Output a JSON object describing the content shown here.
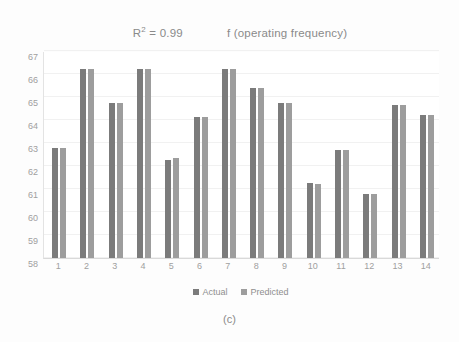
{
  "chart_data": {
    "type": "bar",
    "title": "f (operating frequency)",
    "annotation_r2": "R² = 0.99",
    "r2_value": 0.99,
    "xlabel": "",
    "ylabel": "",
    "ylim": [
      58,
      67
    ],
    "ytick_step": 1,
    "grid": true,
    "legend_position": "bottom",
    "categories": [
      "1",
      "2",
      "3",
      "4",
      "5",
      "6",
      "7",
      "8",
      "9",
      "10",
      "11",
      "12",
      "13",
      "14"
    ],
    "yticks": [
      "67",
      "66",
      "65",
      "64",
      "63",
      "62",
      "61",
      "60",
      "59",
      "58"
    ],
    "series": [
      {
        "name": "Actual",
        "color": "#7b7b7b",
        "values": [
          62.8,
          66.2,
          64.75,
          66.2,
          62.25,
          64.15,
          66.2,
          65.4,
          64.75,
          61.25,
          62.7,
          60.8,
          64.65,
          64.2
        ]
      },
      {
        "name": "Predicted",
        "color": "#9d9d9d",
        "values": [
          62.8,
          66.2,
          64.75,
          66.2,
          62.35,
          64.15,
          66.2,
          65.4,
          64.75,
          61.2,
          62.7,
          60.8,
          64.65,
          64.2
        ]
      }
    ]
  },
  "caption": "(c)"
}
